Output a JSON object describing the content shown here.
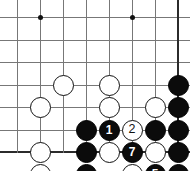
{
  "diagram": {
    "kind": "go-board-problem-diagram",
    "title": "",
    "board": {
      "columns": 8,
      "rows": 7,
      "x_positions": [
        17,
        40,
        63,
        86,
        109,
        132,
        155,
        178
      ],
      "y_positions": [
        17,
        40,
        62,
        85,
        107,
        130,
        152
      ],
      "line_color": "#777777",
      "edge_color": "#2b2b2b",
      "background": "#ffffff",
      "star_points": [
        {
          "col": 1,
          "row": 0
        },
        {
          "col": 5,
          "row": 0
        }
      ]
    },
    "colors": {
      "black_stone": "#0b0b0b",
      "white_stone": "#ffffff",
      "white_stone_border": "#111111",
      "black_label": "#ffffff",
      "white_label": "#111111"
    },
    "stones": [
      {
        "col": 2,
        "row": 3,
        "color": "white",
        "label": ""
      },
      {
        "col": 4,
        "row": 3,
        "color": "white",
        "label": ""
      },
      {
        "col": 7,
        "row": 3,
        "color": "black",
        "label": ""
      },
      {
        "col": 1,
        "row": 4,
        "color": "white",
        "label": ""
      },
      {
        "col": 4,
        "row": 4,
        "color": "white",
        "label": ""
      },
      {
        "col": 6,
        "row": 4,
        "color": "white",
        "label": ""
      },
      {
        "col": 7,
        "row": 4,
        "color": "black",
        "label": ""
      },
      {
        "col": 3,
        "row": 5,
        "color": "black",
        "label": ""
      },
      {
        "col": 4,
        "row": 5,
        "color": "black",
        "label": "1"
      },
      {
        "col": 5,
        "row": 5,
        "color": "white",
        "label": "2"
      },
      {
        "col": 6,
        "row": 5,
        "color": "black",
        "label": ""
      },
      {
        "col": 7,
        "row": 5,
        "color": "black",
        "label": ""
      },
      {
        "col": 1,
        "row": 6,
        "color": "white",
        "label": ""
      },
      {
        "col": 3,
        "row": 6,
        "color": "black",
        "label": ""
      },
      {
        "col": 4,
        "row": 6,
        "color": "white",
        "label": ""
      },
      {
        "col": 5,
        "row": 6,
        "color": "black",
        "label": "7"
      },
      {
        "col": 6,
        "row": 6,
        "color": "white",
        "label": ""
      },
      {
        "col": 7,
        "row": 6,
        "color": "black",
        "label": ""
      },
      {
        "col": 1,
        "row": 7,
        "color": "white",
        "label": ""
      },
      {
        "col": 3,
        "row": 7,
        "color": "black",
        "label": ""
      },
      {
        "col": 5,
        "row": 7,
        "color": "white",
        "label": ""
      },
      {
        "col": 6,
        "row": 7,
        "color": "black",
        "label": "5"
      },
      {
        "col": 7,
        "row": 7,
        "color": "black",
        "label": ""
      },
      {
        "col": 4,
        "row": 8,
        "color": "white",
        "label": "6"
      },
      {
        "col": 5,
        "row": 8,
        "color": "black",
        "label": "3"
      },
      {
        "col": 6,
        "row": 8,
        "color": "white",
        "label": "4"
      }
    ],
    "move_sequence": [
      {
        "number": "1",
        "color": "black"
      },
      {
        "number": "2",
        "color": "white"
      },
      {
        "number": "3",
        "color": "black"
      },
      {
        "number": "4",
        "color": "white"
      },
      {
        "number": "5",
        "color": "black"
      },
      {
        "number": "6",
        "color": "white"
      },
      {
        "number": "7",
        "color": "black"
      }
    ],
    "caption": ""
  }
}
